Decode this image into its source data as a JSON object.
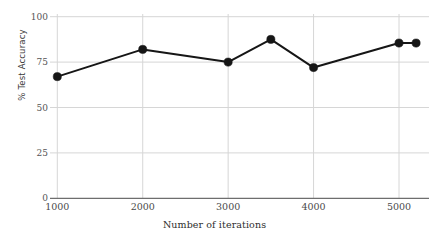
{
  "chart_data": {
    "type": "line",
    "title": "",
    "xlabel": "Number of iterations",
    "ylabel": "% Test Accuracy",
    "x": [
      1000,
      2000,
      3000,
      3500,
      4000,
      5000,
      5200
    ],
    "values": [
      67,
      82,
      75,
      87.5,
      72,
      85.5,
      85.5
    ],
    "series": [
      {
        "name": "% Test Accuracy",
        "x": [
          1000,
          2000,
          3000,
          3500,
          4000,
          5000,
          5200
        ],
        "values": [
          67,
          82,
          75,
          87.5,
          72,
          85.5,
          85.5
        ],
        "color": "#161616",
        "marker": "circle",
        "line_width": 2
      }
    ],
    "xlim": [
      900,
      5300
    ],
    "ylim": [
      0,
      100
    ],
    "xticks": [
      1000,
      2000,
      3000,
      4000,
      5000
    ],
    "xtick_labels": [
      "1000",
      "2000",
      "3000",
      "4000",
      "5000"
    ],
    "yticks": [
      0,
      25,
      50,
      75,
      100
    ],
    "ytick_labels": [
      "0",
      "25",
      "50",
      "75",
      "100"
    ],
    "grid": {
      "horizontal": true,
      "vertical": true,
      "color": "#d6d6d6"
    },
    "legend": null,
    "legend_position": "none",
    "axis_baseline_color": "#6e6e6e",
    "background": "#ffffff"
  },
  "axes": {
    "x_title": "Number of iterations",
    "y_title": "% Test Accuracy"
  }
}
